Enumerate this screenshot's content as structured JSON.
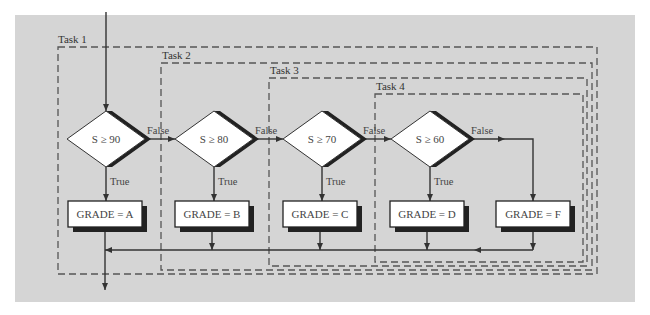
{
  "diagram": {
    "type": "flowchart",
    "colors": {
      "panel": "#d5d5d5",
      "line": "#333333",
      "shadow": "#222222",
      "node_fill": "#ffffff"
    },
    "entry_label": "",
    "tasks": [
      {
        "id": "task1",
        "label": "Task 1",
        "x": 58,
        "y": 47,
        "right": 597,
        "bottom": 274,
        "label_x": 58,
        "label_y": 43
      },
      {
        "id": "task2",
        "label": "Task 2",
        "x": 161,
        "y": 63,
        "right": 592,
        "bottom": 270,
        "label_x": 162,
        "label_y": 59
      },
      {
        "id": "task3",
        "label": "Task 3",
        "x": 269,
        "y": 78,
        "right": 587,
        "bottom": 266,
        "label_x": 270,
        "label_y": 74
      },
      {
        "id": "task4",
        "label": "Task 4",
        "x": 375,
        "y": 94,
        "right": 583,
        "bottom": 262,
        "label_x": 376,
        "label_y": 90
      }
    ],
    "decisions": [
      {
        "id": "d1",
        "label": "S ≥ 90",
        "cx": 106,
        "cy": 139
      },
      {
        "id": "d2",
        "label": "S ≥ 80",
        "cx": 214,
        "cy": 139
      },
      {
        "id": "d3",
        "label": "S ≥ 70",
        "cx": 322,
        "cy": 139
      },
      {
        "id": "d4",
        "label": "S ≥ 60",
        "cx": 430,
        "cy": 139
      }
    ],
    "processes": [
      {
        "id": "pA",
        "label": "GRADE = A",
        "cx": 105,
        "cy": 214
      },
      {
        "id": "pB",
        "label": "GRADE = B",
        "cx": 212,
        "cy": 214
      },
      {
        "id": "pC",
        "label": "GRADE = C",
        "cx": 320,
        "cy": 214
      },
      {
        "id": "pD",
        "label": "GRADE = D",
        "cx": 427,
        "cy": 214
      },
      {
        "id": "pF",
        "label": "GRADE = F",
        "cx": 533,
        "cy": 214
      }
    ],
    "edge_labels": {
      "true": "True",
      "false": "False"
    },
    "edges": [
      {
        "from": "start",
        "to": "d1",
        "label": ""
      },
      {
        "from": "d1",
        "to": "pA",
        "label": "True"
      },
      {
        "from": "d1",
        "to": "d2",
        "label": "False"
      },
      {
        "from": "d2",
        "to": "pB",
        "label": "True"
      },
      {
        "from": "d2",
        "to": "d3",
        "label": "False"
      },
      {
        "from": "d3",
        "to": "pC",
        "label": "True"
      },
      {
        "from": "d3",
        "to": "d4",
        "label": "False"
      },
      {
        "from": "d4",
        "to": "pD",
        "label": "True"
      },
      {
        "from": "d4",
        "to": "pF",
        "label": "False"
      },
      {
        "from": "pB",
        "to": "merge",
        "label": ""
      },
      {
        "from": "pC",
        "to": "merge",
        "label": ""
      },
      {
        "from": "pD",
        "to": "merge",
        "label": ""
      },
      {
        "from": "pF",
        "to": "merge",
        "label": ""
      },
      {
        "from": "pA",
        "to": "end",
        "label": ""
      }
    ]
  }
}
